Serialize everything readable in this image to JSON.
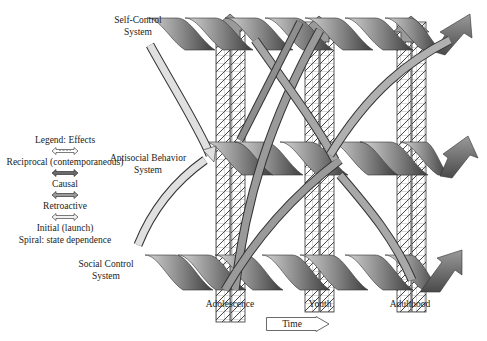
{
  "diagram": {
    "systems": [
      {
        "id": "self-control",
        "label_line1": "Self-Control",
        "label_line2": "System"
      },
      {
        "id": "antisocial",
        "label_line1": "Antisocial Behavior",
        "label_line2": "System"
      },
      {
        "id": "social-control",
        "label_line1": "Social Control",
        "label_line2": "System"
      }
    ],
    "stages": [
      {
        "label": "Adolescence"
      },
      {
        "label": "Youth"
      },
      {
        "label": "Adulthood"
      }
    ],
    "time_label": "Time",
    "legend": {
      "title": "Legend: Effects",
      "items": [
        {
          "label": "Reciprocal (contemporaneous)",
          "style": "striped"
        },
        {
          "label": "Causal",
          "style": "dark"
        },
        {
          "label": "Retroactive",
          "style": "medium"
        },
        {
          "label": "Initial (launch)",
          "style": "light"
        }
      ],
      "spiral_note": "Spiral: state dependence"
    },
    "colors": {
      "spiral_dark": "#4a4a4a",
      "spiral_mid": "#8a8a8a",
      "spiral_light": "#d4d4d4",
      "arrow_light": "#dedede",
      "arrow_mid": "#9a9a9a",
      "hatch": "#555555"
    }
  }
}
